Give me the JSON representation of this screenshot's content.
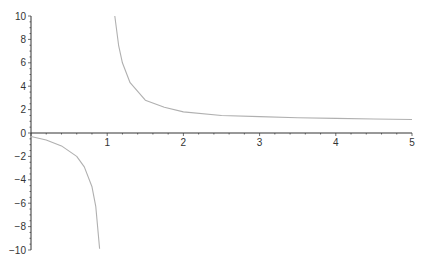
{
  "chart_data": {
    "type": "line",
    "title": "",
    "xlabel": "",
    "ylabel": "",
    "xlim": [
      0,
      5
    ],
    "ylim": [
      -10,
      10
    ],
    "grid": false,
    "legend": null,
    "x_ticks": [
      "1",
      "2",
      "3",
      "4",
      "5"
    ],
    "y_ticks": [
      "10",
      "8",
      "6",
      "4",
      "2",
      "0",
      "-2",
      "-4",
      "-6",
      "-8",
      "-10"
    ],
    "vertical_asymptote": 1,
    "series": [
      {
        "name": "left branch",
        "x": [
          0,
          0.2,
          0.4,
          0.6,
          0.7,
          0.8,
          0.85,
          0.9
        ],
        "y": [
          -0.3,
          -0.6,
          -1.1,
          -2.0,
          -2.9,
          -4.6,
          -6.3,
          -9.9
        ]
      },
      {
        "name": "right branch",
        "x": [
          1.1,
          1.15,
          1.2,
          1.3,
          1.5,
          1.75,
          2,
          2.5,
          3,
          3.5,
          4,
          4.5,
          5
        ],
        "y": [
          10,
          7.5,
          6.0,
          4.3,
          2.8,
          2.2,
          1.8,
          1.5,
          1.4,
          1.3,
          1.25,
          1.2,
          1.15
        ]
      }
    ],
    "colors": {
      "curve": "#b0b0b0",
      "axis": "#333333"
    }
  }
}
